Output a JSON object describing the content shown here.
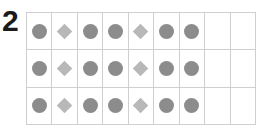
{
  "problem_number": "2",
  "colors": {
    "circle": "#8c8c8c",
    "diamond": "#b8b8b8",
    "grid_line": "#cfcfcf"
  },
  "grid": {
    "columns": 9,
    "rows": [
      [
        "circle",
        "diamond",
        "circle",
        "circle",
        "diamond",
        "circle",
        "circle",
        "empty",
        "empty"
      ],
      [
        "circle",
        "diamond",
        "circle",
        "circle",
        "diamond",
        "circle",
        "circle",
        "empty",
        "empty"
      ],
      [
        "circle",
        "diamond",
        "circle",
        "circle",
        "diamond",
        "circle",
        "circle",
        "empty",
        "empty"
      ]
    ]
  }
}
